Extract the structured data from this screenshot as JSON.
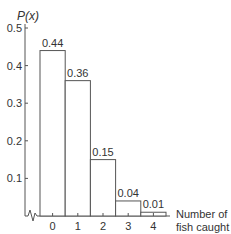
{
  "chart_data": {
    "type": "bar",
    "title": "",
    "ylabel": "P(x)",
    "xlabel_lines": [
      "Number of",
      "fish caught"
    ],
    "categories": [
      "0",
      "1",
      "2",
      "3",
      "4"
    ],
    "values": [
      0.44,
      0.36,
      0.15,
      0.04,
      0.01
    ],
    "value_labels": [
      "0.44",
      "0.36",
      "0.15",
      "0.04",
      "0.01"
    ],
    "yticks": [
      0.1,
      0.2,
      0.3,
      0.4,
      0.5
    ],
    "ytick_labels": [
      "0.1",
      "0.2",
      "0.3",
      "0.4",
      "0.5"
    ],
    "ylim": [
      0,
      0.5
    ],
    "grid": false,
    "axis_break": true
  }
}
